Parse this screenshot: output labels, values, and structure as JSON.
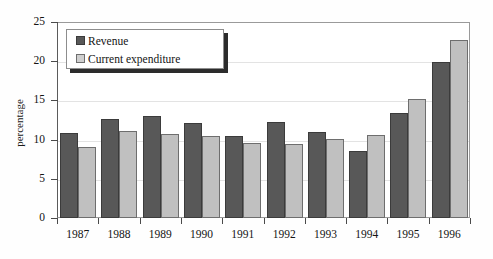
{
  "chart_data": {
    "type": "bar",
    "title": "",
    "xlabel": "",
    "ylabel": "percentage",
    "ylim": [
      0,
      25
    ],
    "yticks": [
      0,
      5,
      10,
      15,
      20,
      25
    ],
    "ytick_labels": [
      "0",
      "5",
      "10",
      "15",
      "20",
      "25"
    ],
    "grid": true,
    "legend_position": "upper left inside plot",
    "categories": [
      "1987",
      "1988",
      "1989",
      "1990",
      "1991",
      "1992",
      "1993",
      "1994",
      "1995",
      "1996"
    ],
    "series": [
      {
        "name": "Revenue",
        "color": "#585858",
        "values": [
          10.8,
          12.6,
          13.0,
          12.1,
          10.4,
          12.3,
          11.0,
          8.6,
          13.4,
          19.9
        ]
      },
      {
        "name": "Current expenditure",
        "color": "#c0c0c0",
        "values": [
          9.0,
          11.1,
          10.7,
          10.4,
          9.6,
          9.5,
          10.1,
          10.6,
          15.2,
          22.7
        ]
      }
    ]
  },
  "legend": {
    "entries": [
      {
        "label": "Revenue",
        "swatch": "dark-gray-square"
      },
      {
        "label": "Current expenditure",
        "swatch": "light-gray-square"
      }
    ]
  },
  "colors": {
    "revenue": "#585858",
    "expenditure": "#c0c0c0",
    "axis": "#4a4a4a",
    "grid": "#e3e3e3",
    "text": "#141414"
  }
}
